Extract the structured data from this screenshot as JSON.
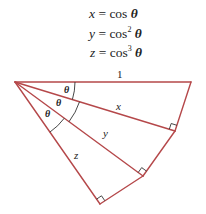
{
  "equations": [
    {
      "lhs": "x",
      "eq": "=",
      "fn": "cos",
      "power": "",
      "arg": "θ"
    },
    {
      "lhs": "y",
      "eq": "=",
      "fn": "cos",
      "power": "2",
      "arg": "θ"
    },
    {
      "lhs": "z",
      "eq": "=",
      "fn": "cos",
      "power": "3",
      "arg": "θ"
    }
  ],
  "diagram": {
    "line_color": "#b5484a",
    "side_labels": {
      "hypotenuse": "1",
      "x": "x",
      "y": "y",
      "z": "z"
    },
    "angle_labels": [
      "θ",
      "θ",
      "θ"
    ]
  }
}
